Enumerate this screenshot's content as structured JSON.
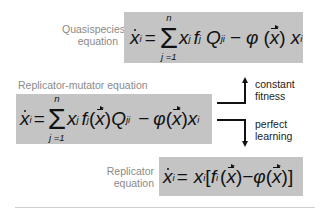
{
  "quasispecies": {
    "label_line1": "Quasispecies",
    "label_line2": "equation",
    "equation_text": "ẋ_i = Σ_{j=1}^{n} x_j f_j Q_ji − φ(x⃗) x_i",
    "sum_top": "n",
    "sum_bottom": "j =1"
  },
  "replicator_mutator": {
    "label": "Replicator-mutator equation",
    "equation_text": "ẋ_i = Σ_{j=1}^{n} x_j f_j(x⃗) Q_ji − φ(x⃗) x_i",
    "sum_top": "n",
    "sum_bottom": "j =1"
  },
  "arrows": {
    "up_label_line1": "constant",
    "up_label_line2": "fitness",
    "down_label_line1": "perfect",
    "down_label_line2": "learning"
  },
  "replicator": {
    "label_line1": "Replicator",
    "label_line2": "equation",
    "equation_text": "ẋ_i = x_i[f_i(x⃗) − φ(x⃗)]"
  },
  "colors": {
    "box_gray": "#c4c4c4",
    "label_gray": "#8a8a8a"
  }
}
